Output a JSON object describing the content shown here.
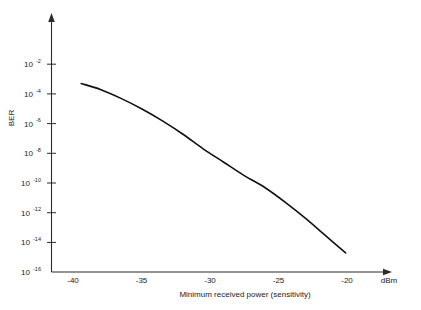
{
  "chart_data": {
    "type": "line",
    "title": "",
    "xlabel": "Minimum received power (sensitivity)",
    "ylabel": "BER",
    "xunit": "dBm",
    "x_tick_labels": [
      "-40",
      "-35",
      "-30",
      "-25",
      "-20"
    ],
    "x_tick_values": [
      -40,
      -35,
      -30,
      -25,
      -20
    ],
    "xlim": [
      -41.5,
      -18.5
    ],
    "y_tick_labels": [
      "10-2",
      "10-4",
      "10-6",
      "10-8",
      "10-10",
      "10-12",
      "10-14",
      "10-16"
    ],
    "y_tick_mantissa": [
      "10",
      "10",
      "10",
      "10",
      "10",
      "10",
      "10",
      "10"
    ],
    "y_tick_exponents": [
      "-2",
      "-4",
      "-6",
      "-8",
      "-10",
      "-12",
      "-14",
      "-16"
    ],
    "y_tick_values": [
      -2,
      -4,
      -6,
      -8,
      -10,
      -12,
      -14,
      -16
    ],
    "yscale": "log",
    "ylim_exponent": [
      -16.8,
      -1.0
    ],
    "grid": false,
    "legend": false,
    "axis_arrows": true,
    "series": [
      {
        "name": "BER curve",
        "color": "#111111",
        "x": [
          -39.4,
          -38.0,
          -36.5,
          -35.0,
          -33.5,
          -32.0,
          -30.5,
          -29.0,
          -27.5,
          -26.0,
          -24.5,
          -23.0,
          -21.5,
          -20.1
        ],
        "y_exponent": [
          -3.3,
          -3.7,
          -4.3,
          -5.0,
          -5.8,
          -6.7,
          -7.7,
          -8.6,
          -9.5,
          -10.3,
          -11.3,
          -12.4,
          -13.6,
          -14.7
        ]
      }
    ]
  },
  "labels": {
    "y_axis_title": "BER",
    "x_axis_title": "Minimum received power (sensitivity)",
    "x_axis_unit": "dBm"
  }
}
